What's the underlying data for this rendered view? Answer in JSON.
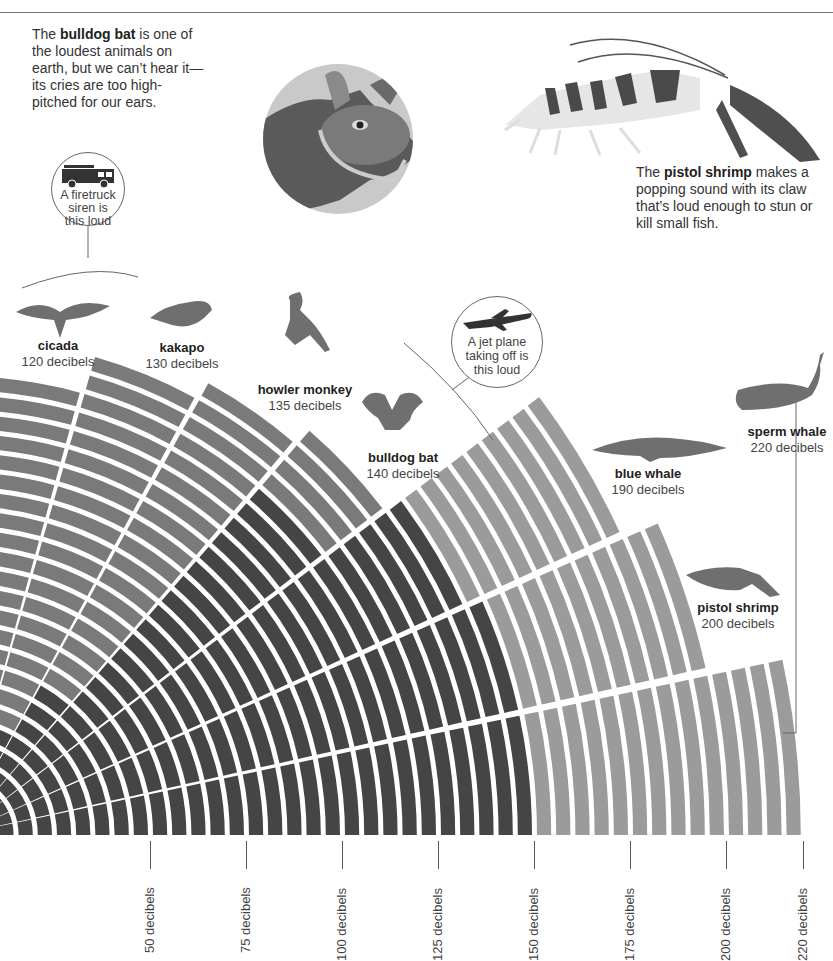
{
  "captions": {
    "bat": {
      "pre": "The ",
      "bold": "bulldog bat",
      "post": " is one of the loudest animals on earth, but we can’t hear it—its cries are too high-pitched for our ears."
    },
    "shrimp": {
      "pre": "The ",
      "bold": "pistol shrimp",
      "post": " makes a popping sound with its claw that’s loud enough to stun or kill small fish."
    }
  },
  "bubbles": {
    "firetruck": {
      "text": "A firetruck siren is this loud",
      "icon": "firetruck-icon"
    },
    "jet": {
      "text": "A jet plane taking off is this loud",
      "icon": "airplane-icon"
    }
  },
  "colors": {
    "dark": "#454545",
    "medium": "#7a7a7a",
    "light": "#9b9b9b",
    "line": "#666666"
  },
  "chart_data": {
    "type": "radial-bar",
    "title": "",
    "unit": "decibels",
    "step_db": 5,
    "center": [
      -42,
      835
    ],
    "px_per_db": 3.84,
    "series": [
      {
        "name": "sperm whale",
        "value": 220,
        "label": "220 decibels",
        "angle_start": 0,
        "angle_end": 12,
        "dark_until": 150,
        "shade": "light"
      },
      {
        "name": "pistol shrimp",
        "value": 200,
        "label": "200 decibels",
        "angle_start": 12.6,
        "angle_end": 24,
        "dark_until": 150,
        "shade": "light"
      },
      {
        "name": "blue whale",
        "value": 190,
        "label": "190 decibels",
        "angle_start": 24.6,
        "angle_end": 37,
        "dark_until": 145,
        "shade": "light"
      },
      {
        "name": "bulldog bat",
        "value": 140,
        "label": "140 decibels",
        "angle_start": 37.6,
        "angle_end": 49,
        "dark_until": 120,
        "shade": "medium"
      },
      {
        "name": "howler monkey",
        "value": 135,
        "label": "135 decibels",
        "angle_start": 49.6,
        "angle_end": 61,
        "dark_until": 45,
        "shade": "medium"
      },
      {
        "name": "kakapo",
        "value": 130,
        "label": "130 decibels",
        "angle_start": 61.6,
        "angle_end": 74,
        "dark_until": 30,
        "shade": "medium"
      },
      {
        "name": "cicada",
        "value": 120,
        "label": "120 decibels",
        "angle_start": 74.6,
        "angle_end": 92,
        "dark_until": 15,
        "shade": "medium"
      }
    ],
    "axis_ticks": [
      {
        "value": 50,
        "label": "50 decibels"
      },
      {
        "value": 75,
        "label": "75 decibels"
      },
      {
        "value": 100,
        "label": "100 decibels"
      },
      {
        "value": 125,
        "label": "125 decibels"
      },
      {
        "value": 150,
        "label": "150 decibels"
      },
      {
        "value": 175,
        "label": "175 decibels"
      },
      {
        "value": 200,
        "label": "200 decibels"
      },
      {
        "value": 220,
        "label": "220 decibels"
      }
    ],
    "reference_lines": [
      {
        "name": "firetruck siren",
        "value": 120
      },
      {
        "name": "jet plane taking off",
        "value": 150
      }
    ]
  },
  "animal_labels": [
    {
      "key": "cicada",
      "name": "cicada",
      "value": "120 decibels",
      "x": 58,
      "y": 338
    },
    {
      "key": "kakapo",
      "name": "kakapo",
      "value": "130 decibels",
      "x": 182,
      "y": 340
    },
    {
      "key": "howler",
      "name": "howler monkey",
      "value": "135 decibels",
      "x": 305,
      "y": 382
    },
    {
      "key": "bat",
      "name": "bulldog bat",
      "value": "140 decibels",
      "x": 403,
      "y": 450
    },
    {
      "key": "bluewhale",
      "name": "blue whale",
      "value": "190 decibels",
      "x": 648,
      "y": 466
    },
    {
      "key": "shrimp",
      "name": "pistol shrimp",
      "value": "200 decibels",
      "x": 738,
      "y": 600
    },
    {
      "key": "sperm",
      "name": "sperm whale",
      "value": "220 decibels",
      "x": 787,
      "y": 424
    }
  ]
}
